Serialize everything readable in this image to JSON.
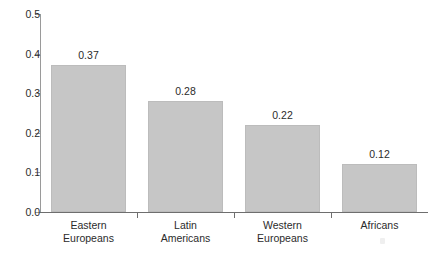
{
  "chart_data": {
    "type": "bar",
    "title": "",
    "subtitle": "",
    "xlabel": "",
    "ylabel": "",
    "ylim": [
      0.0,
      0.5
    ],
    "grid": false,
    "legend": false,
    "categories": [
      "Eastern Europeans",
      "Latin Americans",
      "Western Europeans",
      "Africans"
    ],
    "category_lines": [
      [
        "Eastern",
        "Europeans"
      ],
      [
        "Latin",
        "Americans"
      ],
      [
        "Western",
        "Europeans"
      ],
      [
        "Africans"
      ]
    ],
    "values": [
      0.37,
      0.28,
      0.22,
      0.12
    ],
    "value_labels": [
      "0.37",
      "0.28",
      "0.22",
      "0.12"
    ],
    "y_ticks": [
      0.0,
      0.1,
      0.2,
      0.3,
      0.4,
      0.5
    ],
    "y_tick_labels": [
      "0.0",
      "0.1",
      "0.2",
      "0.3",
      "0.4",
      "0.5"
    ],
    "bar_color": "#c6c6c6",
    "bar_edge_color": "#bcbcbc",
    "axis_color": "#6e6e6e",
    "text_color": "#2b2b2b",
    "background_color": "#ffffff"
  }
}
